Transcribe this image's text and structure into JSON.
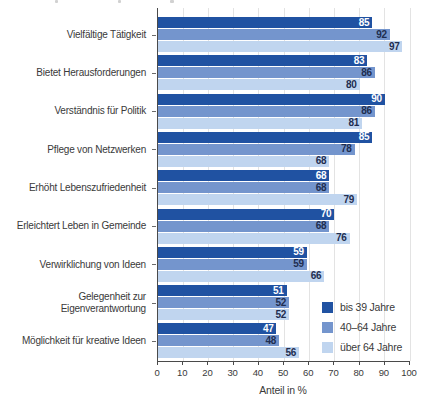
{
  "chart_data": {
    "type": "bar",
    "orientation": "horizontal",
    "categories": [
      "Vielfältige Tätigkeit",
      "Bietet Herausforderungen",
      "Verständnis für Politik",
      "Pflege von Netzwerken",
      "Erhöht Lebenszufriedenheit",
      "Erleichtert Leben in Gemeinde",
      "Verwirklichung von Ideen",
      "Gelegenheit zur Eigenverantwortung",
      "Möglichkeit für kreative Ideen"
    ],
    "series": [
      {
        "name": "bis 39 Jahre",
        "color": "#2052a2",
        "values": [
          85,
          83,
          90,
          85,
          68,
          70,
          59,
          51,
          47
        ]
      },
      {
        "name": "40–64 Jahre",
        "color": "#7495cd",
        "values": [
          92,
          86,
          86,
          78,
          68,
          68,
          59,
          52,
          48
        ]
      },
      {
        "name": "über 64 Jahre",
        "color": "#c0d5ef",
        "values": [
          97,
          80,
          81,
          68,
          79,
          76,
          66,
          52,
          56
        ]
      }
    ],
    "xlabel": "Anteil in %",
    "xlim": [
      0,
      100
    ],
    "xticks": [
      0,
      10,
      20,
      30,
      40,
      50,
      60,
      70,
      80,
      90,
      100
    ],
    "grid": true,
    "legend_position": "bottom-right"
  },
  "colors": {
    "grid": "#e3e3e3",
    "axis": "#4a4a4a",
    "text": "#3a3a3a",
    "value_on_dark": "#ffffff",
    "value_text": "#1e2d50"
  }
}
